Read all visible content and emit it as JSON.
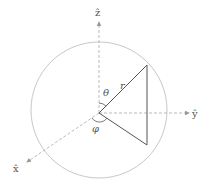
{
  "diagram": {
    "axes": {
      "z": {
        "label": "ẑ"
      },
      "y": {
        "label": "ŷ"
      },
      "x": {
        "label": "x̂"
      }
    },
    "symbols": {
      "radius": "r",
      "polar_angle": "θ",
      "azimuthal_angle": "φ"
    },
    "colors": {
      "sphere": "#c8c8c8",
      "axis": "#aaaaaa",
      "vector": "#555555",
      "label": "#555555"
    }
  }
}
